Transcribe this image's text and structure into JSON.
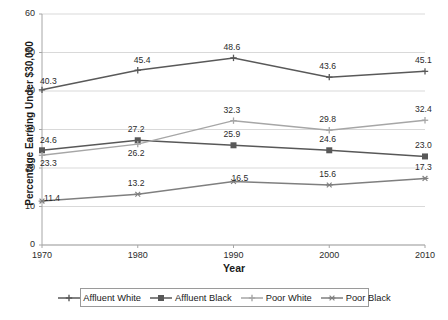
{
  "chart_data": {
    "type": "line",
    "title": "",
    "xlabel": "Year",
    "ylabel": "Percentage Earning Under $30,000",
    "x": [
      1970,
      1980,
      1990,
      2000,
      2010
    ],
    "categories": [
      "1970",
      "1980",
      "1990",
      "2000",
      "2010"
    ],
    "xlim": [
      1970,
      2010
    ],
    "ylim": [
      0,
      60
    ],
    "yticks": [
      0,
      10,
      20,
      30,
      40,
      50,
      60
    ],
    "ytick_labels": [
      "0",
      "10",
      "20",
      "30",
      "40",
      "50",
      "60"
    ],
    "grid": "horizontal",
    "legend_position": "bottom",
    "series": [
      {
        "name": "Affluent White",
        "values": [
          40.3,
          45.4,
          48.6,
          43.6,
          45.1
        ],
        "labels": [
          "40.3",
          "45.4",
          "48.6",
          "43.6",
          "45.1"
        ],
        "color": "#595959",
        "marker": "cross"
      },
      {
        "name": "Affluent Black",
        "values": [
          24.6,
          27.2,
          25.9,
          24.6,
          23.0
        ],
        "labels": [
          "24.6",
          "27.2",
          "25.9",
          "24.6",
          "23.0"
        ],
        "color": "#585858",
        "marker": "square"
      },
      {
        "name": "Poor White",
        "values": [
          23.3,
          26.2,
          32.3,
          29.8,
          32.4
        ],
        "labels": [
          "23.3",
          "26.2",
          "32.3",
          "29.8",
          "32.4"
        ],
        "color": "#a6a6a6",
        "marker": "cross"
      },
      {
        "name": "Poor Black",
        "values": [
          11.4,
          13.2,
          16.5,
          15.6,
          17.3
        ],
        "labels": [
          "11.4",
          "13.2",
          "16.5",
          "15.6",
          "17.3"
        ],
        "color": "#7f7f7f",
        "marker": "star"
      }
    ]
  },
  "axes": {
    "y_title": "Percentage Earning Under $30,000",
    "x_title": "Year"
  },
  "colors": {
    "grid": "#d9d9d9",
    "axis": "#a6a6a6",
    "text": "#2b2b2b",
    "background": "#ffffff"
  }
}
